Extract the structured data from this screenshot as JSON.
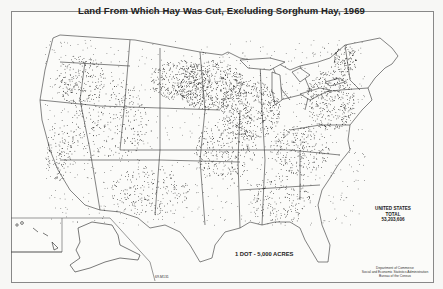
{
  "map": {
    "title": "Land From Which Hay Was Cut, Excluding Sorghum Hay, 1969",
    "totals": {
      "line1": "UNITED STATES",
      "line2": "TOTAL",
      "value": "53,203,606"
    },
    "legend": "1 DOT - 5,000 ACRES",
    "credit": {
      "line1": "Department of Commerce",
      "line2": "Social and Economic Statistics Administration",
      "line3": "Bureau of the Census"
    },
    "code": "69-M131",
    "colors": {
      "ink": "#111111",
      "paper": "#fbfbf9",
      "border": "#888888"
    },
    "insets": [
      "Alaska",
      "Hawaii"
    ]
  }
}
